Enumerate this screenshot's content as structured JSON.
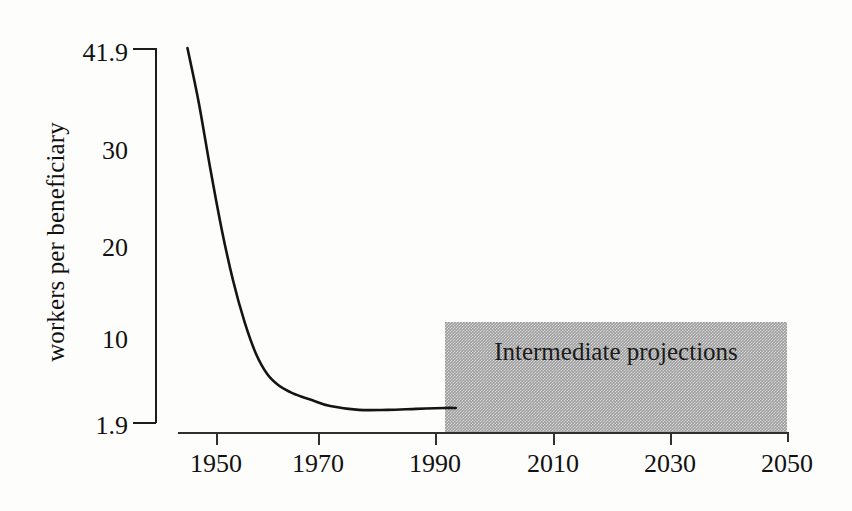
{
  "chart_data": {
    "type": "line",
    "title": "",
    "subtitle": "",
    "xlabel": "",
    "ylabel": "workers per beneficiary",
    "xlim": [
      1945,
      2050
    ],
    "ylim": [
      1.9,
      41.9
    ],
    "grid": false,
    "legend": "none",
    "x_ticks": [
      1950,
      1970,
      1990,
      2010,
      2030,
      2050
    ],
    "x_tick_labels": [
      "1950",
      "1970",
      "1990",
      "2010",
      "2030",
      "2050"
    ],
    "y_ticks": [
      1.9,
      10,
      20,
      30,
      41.9
    ],
    "y_tick_labels": [
      "1.9",
      "10",
      "20",
      "30",
      "41.9"
    ],
    "series": [
      {
        "name": "workers per beneficiary",
        "x": [
          1945,
          1947,
          1949,
          1951,
          1953,
          1955,
          1957,
          1959,
          1961,
          1963,
          1965,
          1967,
          1970,
          1975,
          1980,
          1985,
          1990,
          1992
        ],
        "values": [
          41.9,
          36.0,
          29.0,
          22.5,
          17.0,
          12.6,
          9.2,
          7.0,
          5.8,
          5.1,
          4.6,
          4.2,
          3.6,
          3.2,
          3.2,
          3.3,
          3.4,
          3.4
        ]
      }
    ],
    "annotations": [
      {
        "name": "intermediate-projections-band",
        "text": "Intermediate projections",
        "x_range": [
          1991,
          2050
        ],
        "y_range": [
          1.9,
          13.5
        ],
        "fill": "#9c9c9c",
        "pattern": "50% dithered gray"
      }
    ]
  },
  "axes": {
    "y_axis_title": "workers per beneficiary",
    "y_labels": [
      {
        "text": "41.9",
        "top": 40
      },
      {
        "text": "30",
        "top": 138
      },
      {
        "text": "20",
        "top": 235
      },
      {
        "text": "10",
        "top": 327
      },
      {
        "text": "1.9",
        "top": 413
      }
    ],
    "y_ticks": [
      {
        "top": 48
      },
      {
        "top": 422
      }
    ],
    "x_labels": [
      {
        "text": "1950",
        "left": 216
      },
      {
        "text": "1970",
        "left": 318
      },
      {
        "text": "1990",
        "left": 435
      },
      {
        "text": "2010",
        "left": 553
      },
      {
        "text": "2030",
        "left": 670
      },
      {
        "text": "2050",
        "left": 787
      }
    ],
    "x_ticks": [
      {
        "left": 216
      },
      {
        "left": 318
      },
      {
        "left": 435
      },
      {
        "left": 553
      },
      {
        "left": 670
      },
      {
        "left": 787
      }
    ]
  },
  "projection": {
    "label": "Intermediate projections"
  },
  "colors": {
    "background": "#ffffff",
    "axis": "#1c1c1c",
    "curve": "#141414",
    "band_fill": "#9c9c9c",
    "text": "#111111"
  },
  "curve_path": "M 180,47 C 188,82 196,130 204,172 C 212,214 221,253 232,288 C 242,320 252,350 262,371 C 270,387 279,396 290,400 C 302,404 318,406 332,406 C 346,406 360,405 374,404 C 390,403 408,402 424,402 L 446,402"
}
